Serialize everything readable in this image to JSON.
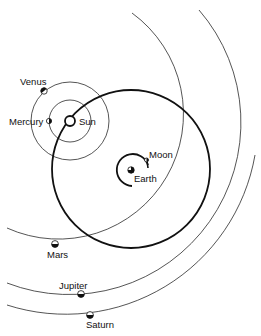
{
  "diagram": {
    "type": "Tychonic planetary system",
    "bodies": {
      "sun": {
        "label": "Sun"
      },
      "earth": {
        "label": "Earth"
      },
      "moon": {
        "label": "Moon"
      },
      "mercury": {
        "label": "Mercury"
      },
      "venus": {
        "label": "Venus"
      },
      "mars": {
        "label": "Mars"
      },
      "jupiter": {
        "label": "Jupiter"
      },
      "saturn": {
        "label": "Saturn"
      }
    },
    "colors": {
      "ink": "#111111",
      "background": "#ffffff"
    }
  }
}
